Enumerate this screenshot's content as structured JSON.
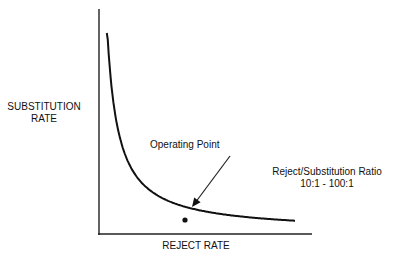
{
  "chart_data": {
    "type": "line",
    "title": "",
    "xlabel": "REJECT RATE",
    "ylabel": [
      "SUBSTITUTION",
      "RATE"
    ],
    "grid": false,
    "axes_ticks": false,
    "series": [
      {
        "name": "substitution-vs-reject",
        "shape": "hyperbolic-decay",
        "k": 0.06,
        "x": [
          0.02,
          0.04,
          0.06,
          0.1,
          0.15,
          0.2,
          0.3,
          0.4,
          0.5,
          0.6,
          0.7,
          0.8,
          0.9,
          1.0
        ],
        "y": [
          0.98,
          0.72,
          0.52,
          0.36,
          0.27,
          0.2,
          0.15,
          0.12,
          0.095,
          0.08,
          0.07,
          0.06,
          0.055,
          0.05
        ]
      }
    ],
    "operating_point": {
      "x": 0.45,
      "y": 0.1
    },
    "annotations": [
      {
        "text": "Operating Point",
        "arrow_to": "operating_point"
      },
      {
        "text": "Reject/Substitution Ratio"
      },
      {
        "text": "10:1 - 100:1"
      }
    ]
  }
}
